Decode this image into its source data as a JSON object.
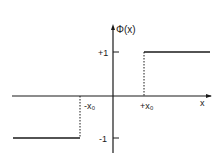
{
  "diagram": {
    "type": "step-function",
    "function_label": "Φ(x)",
    "x_axis_label": "x",
    "y_ticks": [
      {
        "label": "+1",
        "value": 1
      },
      {
        "label": "-1",
        "value": -1
      }
    ],
    "x_ticks": [
      {
        "label": "-x₀",
        "value": "-x0"
      },
      {
        "label": "+x₀",
        "value": "+x0"
      }
    ],
    "segments": [
      {
        "x_from": "-inf",
        "x_to": "-x0",
        "y": -1
      },
      {
        "x_from": "+x0",
        "x_to": "+inf",
        "y": 1
      }
    ],
    "line_color": "#1a1a1a"
  }
}
